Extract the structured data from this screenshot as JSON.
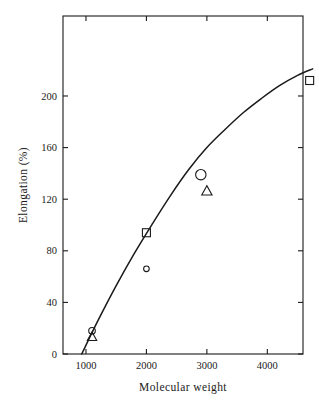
{
  "chart_data": {
    "type": "scatter",
    "title": "",
    "xlabel": "Molecular weight",
    "ylabel": "Elongation (%)",
    "xlim": [
      620,
      4590
    ],
    "ylim": [
      0,
      262
    ],
    "xticks": [
      1000,
      2000,
      3000,
      4000
    ],
    "xtick_labels": [
      "1000",
      "2000",
      "3000",
      "4000"
    ],
    "yticks": [
      0,
      40,
      80,
      120,
      160,
      200
    ],
    "ytick_labels": [
      "0",
      "40",
      "80",
      "120",
      "160",
      "200"
    ],
    "grid": false,
    "legend": "none",
    "frame": "box",
    "tick_direction": "in",
    "series": [
      {
        "name": "circle",
        "marker": "circle",
        "points": [
          {
            "x": 1100,
            "y": 18
          },
          {
            "x": 2000,
            "y": 66
          },
          {
            "x": 2900,
            "y": 139
          }
        ]
      },
      {
        "name": "square",
        "marker": "square",
        "points": [
          {
            "x": 2000,
            "y": 94
          },
          {
            "x": 4700,
            "y": 212
          }
        ]
      },
      {
        "name": "triangle",
        "marker": "triangle",
        "points": [
          {
            "x": 1100,
            "y": 13
          },
          {
            "x": 3000,
            "y": 126
          }
        ]
      }
    ],
    "fit_curve": {
      "name": "trend-line",
      "points": [
        {
          "x": 930,
          "y": 0
        },
        {
          "x": 1200,
          "y": 26
        },
        {
          "x": 1500,
          "y": 53
        },
        {
          "x": 1800,
          "y": 78
        },
        {
          "x": 2100,
          "y": 101
        },
        {
          "x": 2400,
          "y": 123
        },
        {
          "x": 2700,
          "y": 143
        },
        {
          "x": 3000,
          "y": 160
        },
        {
          "x": 3300,
          "y": 174
        },
        {
          "x": 3600,
          "y": 187
        },
        {
          "x": 3900,
          "y": 198
        },
        {
          "x": 4200,
          "y": 208
        },
        {
          "x": 4500,
          "y": 216
        },
        {
          "x": 4750,
          "y": 221
        }
      ]
    }
  },
  "colors": {
    "axis": "#1a1a1a",
    "curve": "#1a1a1a",
    "marker": "#1a1a1a",
    "background": "#ffffff"
  }
}
